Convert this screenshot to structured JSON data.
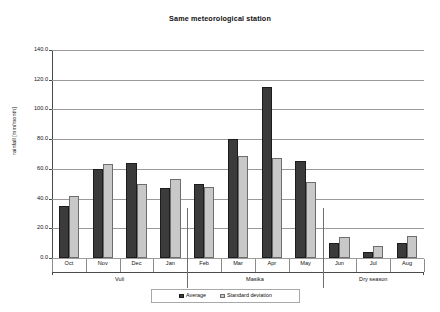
{
  "chart_data": {
    "type": "bar",
    "title": "Same meteorological station",
    "xlabel": "",
    "ylabel": "rainfall [mm/month]",
    "ylim": [
      0,
      140
    ],
    "ytick_step": 20,
    "ytick_labels": [
      "0.0",
      "20.0",
      "40.0",
      "60.0",
      "80.0",
      "100.0",
      "120.0",
      "140.0"
    ],
    "grid": true,
    "legend_position": "bottom",
    "categories": [
      "Oct",
      "Nov",
      "Dec",
      "Jan",
      "Feb",
      "Mar",
      "Apr",
      "May",
      "Jun",
      "Jul",
      "Aug"
    ],
    "series": [
      {
        "name": "Average",
        "color": "#3b3b3b",
        "values": [
          35,
          60,
          64,
          47,
          50,
          80,
          115,
          65,
          10,
          4,
          10
        ]
      },
      {
        "name": "Standard deviation",
        "color": "#c8c8c8",
        "values": [
          42,
          63,
          50,
          53,
          48,
          69,
          67,
          51,
          14,
          8,
          15
        ]
      }
    ],
    "groups": [
      {
        "label": "Vuli",
        "categories": [
          "Oct",
          "Nov",
          "Dec",
          "Jan"
        ]
      },
      {
        "label": "Masika",
        "categories": [
          "Feb",
          "Mar",
          "Apr",
          "May"
        ]
      },
      {
        "label": "Dry season",
        "categories": [
          "Jun",
          "Jul",
          "Aug"
        ]
      }
    ]
  },
  "legend": {
    "entries": [
      {
        "label": "Average"
      },
      {
        "label": "Standard deviation"
      }
    ]
  }
}
